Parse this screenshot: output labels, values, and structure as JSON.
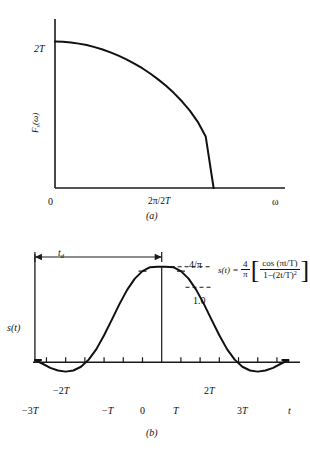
{
  "figure": {
    "panel_a_letter": "(a)",
    "panel_b_letter": "(b)"
  },
  "chart_data": [
    {
      "id": "panel-a",
      "type": "line",
      "title": "",
      "xlabel": "ω",
      "ylabel": "Fₛ(ω)",
      "caption": "(a)",
      "xlim": [
        0,
        1.45
      ],
      "ylim": [
        0,
        1.12
      ],
      "grid": false,
      "legend": null,
      "x_tick_labels": [
        "0",
        "2π/2T"
      ],
      "x_tick_values": [
        0,
        1.0
      ],
      "y_tick_labels": [
        "2T"
      ],
      "y_tick_values": [
        1.0
      ],
      "series": [
        {
          "name": "F_s(omega)",
          "comment": "raised-cosine half-spectrum: 2T*cos^2(omega*T/2) from 0 to 2pi/2T",
          "x": [
            0.0,
            0.05,
            0.1,
            0.15,
            0.2,
            0.25,
            0.3,
            0.35,
            0.4,
            0.45,
            0.5,
            0.55,
            0.6,
            0.65,
            0.7,
            0.75,
            0.8,
            0.85,
            0.9,
            0.95,
            1.0
          ],
          "y": [
            1.0,
            0.998,
            0.994,
            0.986,
            0.976,
            0.962,
            0.946,
            0.926,
            0.904,
            0.878,
            0.85,
            0.818,
            0.782,
            0.742,
            0.698,
            0.648,
            0.592,
            0.528,
            0.452,
            0.352,
            0.0
          ]
        }
      ]
    },
    {
      "id": "panel-b",
      "type": "line",
      "title": "",
      "xlabel": "t",
      "ylabel": "s(t)",
      "caption": "(b)",
      "equation": "s(t) = (4/π)[ cos(πt/T) / (1 − (2t/T)²) ]",
      "equation_parts": {
        "lhs": "s(t)",
        "equals": "=",
        "coef_num": "4",
        "coef_den": "π",
        "frac_num": "cos (πt/T)",
        "frac_den": "1−(2t/T)",
        "frac_den_exp": "2"
      },
      "xlim": [
        -3.35,
        3.6
      ],
      "ylim": [
        -0.45,
        1.35
      ],
      "grid": false,
      "legend": null,
      "x_tick_labels": [
        "−3T",
        "−2T",
        "−T",
        "0",
        "T",
        "2T",
        "3T"
      ],
      "x_tick_values": [
        -3,
        -2,
        -1,
        0,
        1,
        2,
        3
      ],
      "annotations": [
        {
          "name": "peak-value",
          "label": "4/π",
          "at_y": 1.273,
          "style": "dashed-leader"
        },
        {
          "name": "unit-value",
          "label": "1.0",
          "at_y": 1.0,
          "style": "dashed-leader"
        },
        {
          "name": "delay-span",
          "label": "t₉",
          "label_text": "t",
          "label_sub": "d",
          "from_x": -3.3,
          "to_x": 0,
          "style": "double-arrow"
        }
      ],
      "series": [
        {
          "name": "s(t)",
          "comment": "raised-cosine pulse 4/pi * cos(pi t/T)/(1-(2t/T)^2), normalized peak = 4/pi",
          "x": [
            -3.3,
            -3.1,
            -2.9,
            -2.7,
            -2.5,
            -2.3,
            -2.1,
            -1.9,
            -1.7,
            -1.5,
            -1.3,
            -1.1,
            -0.9,
            -0.7,
            -0.5,
            -0.3,
            -0.1,
            0.0,
            0.1,
            0.3,
            0.5,
            0.7,
            0.9,
            1.1,
            1.3,
            1.5,
            1.7,
            1.9,
            2.1,
            2.3,
            2.5,
            2.7,
            2.9,
            3.1,
            3.3
          ],
          "y": [
            0.03,
            -0.02,
            -0.075,
            -0.11,
            -0.125,
            -0.11,
            -0.06,
            0.035,
            0.175,
            0.36,
            0.565,
            0.775,
            0.965,
            1.115,
            1.215,
            1.268,
            1.272,
            1.273,
            1.272,
            1.268,
            1.215,
            1.115,
            0.965,
            0.775,
            0.565,
            0.36,
            0.175,
            0.035,
            -0.06,
            -0.11,
            -0.125,
            -0.11,
            -0.075,
            -0.02,
            0.03
          ]
        }
      ]
    }
  ]
}
